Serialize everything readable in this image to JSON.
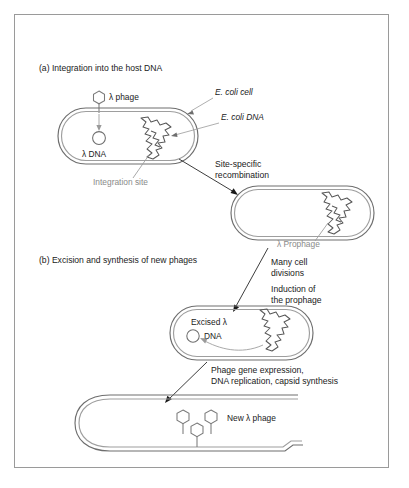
{
  "figure": {
    "title_a": "(a) Integration into the host DNA",
    "title_b": "(b) Excision and synthesis of new phages"
  },
  "panel_a": {
    "phage_label": "λ phage",
    "cell_label": "E. coli cell",
    "host_dna_label": "E. coli DNA",
    "lambda_dna_label": "λ DNA",
    "integration_site_label": "Integration site",
    "recombination_label_line1": "Site-specific",
    "recombination_label_line2": "recombination",
    "prophage_label": "λ Prophage"
  },
  "panel_b": {
    "divisions_label_line1": "Many cell",
    "divisions_label_line2": "divisions",
    "induction_label_line1": "Induction of",
    "induction_label_line2": "the prophage",
    "excised_label_line1": "Excised λ",
    "excised_label_line2": "DNA",
    "synthesis_label_line1": "Phage gene expression,",
    "synthesis_label_line2": "DNA replication, capsid synthesis",
    "new_phage_label": "New λ phage"
  },
  "icons": {
    "phage": "phage-hexagon-icon",
    "dna_circle": "circular-dna-icon",
    "host_dna": "jagged-chromosome-icon"
  },
  "colors": {
    "frame": "#9a9a9a",
    "outline": "#6e6e6e",
    "text": "#1a1a1a",
    "gray_text": "#8a8a8a",
    "background": "#ffffff"
  }
}
